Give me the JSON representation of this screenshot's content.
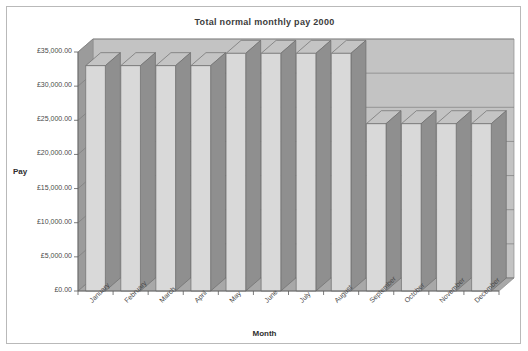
{
  "chart_data": {
    "type": "bar",
    "title": "Total normal monthly pay 2000",
    "xlabel": "Month",
    "ylabel": "Pay",
    "categories": [
      "January",
      "February",
      "March",
      "April",
      "May",
      "June",
      "July",
      "August",
      "September",
      "October",
      "November",
      "December"
    ],
    "values": [
      33000,
      33000,
      33000,
      33000,
      34800,
      34800,
      34800,
      34800,
      24500,
      24500,
      24500,
      24500
    ],
    "ylim": [
      0,
      35000
    ],
    "ytick_values": [
      0,
      5000,
      10000,
      15000,
      20000,
      25000,
      30000,
      35000
    ],
    "ytick_labels": [
      "£0.00",
      "£5,000.00",
      "£10,000.00",
      "£15,000.00",
      "£20,000.00",
      "£25,000.00",
      "£30,000.00",
      "£35,000.00"
    ],
    "grid": true,
    "legend": false,
    "style": "3d-column",
    "colors": {
      "bar_front": "#d9d9d9",
      "bar_side": "#8f8f8f",
      "bar_top": "#c4c4c4",
      "wall_back": "#c3c3c3",
      "wall_side": "#9b9b9b",
      "floor": "#a8a8a8",
      "gridline": "#7d7d7d",
      "border": "#b9b9b9",
      "text": "#3c3c3c"
    }
  }
}
